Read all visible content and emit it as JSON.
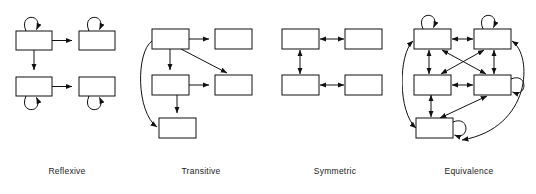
{
  "figure": {
    "background_color": "#ffffff",
    "line_color": "#111111",
    "label_color": "#1a1a1a",
    "panels": [
      {
        "id": "reflexive",
        "label": "Reflexive",
        "node_count": 4,
        "nodes": [
          {
            "id": "r-tl",
            "x": 16,
            "y": 31,
            "w": 36,
            "h": 19,
            "self_loop": "top"
          },
          {
            "id": "r-tr",
            "x": 79,
            "y": 31,
            "w": 36,
            "h": 19,
            "self_loop": "top"
          },
          {
            "id": "r-bl",
            "x": 16,
            "y": 77,
            "w": 36,
            "h": 19,
            "self_loop": "bottom"
          },
          {
            "id": "r-br",
            "x": 79,
            "y": 77,
            "w": 36,
            "h": 19,
            "self_loop": "bottom"
          }
        ],
        "edges": [
          {
            "from": "r-tl",
            "to": "r-tr",
            "style": "straight",
            "heads": 1
          },
          {
            "from": "r-tl",
            "to": "r-bl",
            "style": "straight",
            "heads": 1
          },
          {
            "from": "r-bl",
            "to": "r-br",
            "style": "straight",
            "heads": 1
          }
        ],
        "self_loop_count": 4
      },
      {
        "id": "transitive",
        "label": "Transitive",
        "node_count": 5,
        "nodes": [
          {
            "id": "t-tl",
            "x": 18,
            "y": 29,
            "w": 37,
            "h": 20,
            "self_loop": "none"
          },
          {
            "id": "t-tr",
            "x": 81,
            "y": 29,
            "w": 37,
            "h": 20,
            "self_loop": "none"
          },
          {
            "id": "t-ml",
            "x": 18,
            "y": 75,
            "w": 37,
            "h": 20,
            "self_loop": "none"
          },
          {
            "id": "t-mr",
            "x": 81,
            "y": 75,
            "w": 37,
            "h": 20,
            "self_loop": "none"
          },
          {
            "id": "t-bl",
            "x": 25,
            "y": 118,
            "w": 37,
            "h": 20,
            "self_loop": "none"
          }
        ],
        "edges": [
          {
            "from": "t-tl",
            "to": "t-tr",
            "style": "straight",
            "heads": 1
          },
          {
            "from": "t-tl",
            "to": "t-ml",
            "style": "straight",
            "heads": 1
          },
          {
            "from": "t-tl",
            "to": "t-mr",
            "style": "diagonal",
            "heads": 1
          },
          {
            "from": "t-ml",
            "to": "t-mr",
            "style": "straight",
            "heads": 1
          },
          {
            "from": "t-ml",
            "to": "t-bl",
            "style": "straight",
            "heads": 1
          },
          {
            "from": "t-tl",
            "to": "t-bl",
            "style": "curved-left",
            "heads": 1
          }
        ],
        "self_loop_count": 0
      },
      {
        "id": "symmetric",
        "label": "Symmetric",
        "node_count": 4,
        "nodes": [
          {
            "id": "s-tl",
            "x": 14,
            "y": 29,
            "w": 37,
            "h": 20,
            "self_loop": "none"
          },
          {
            "id": "s-tr",
            "x": 77,
            "y": 29,
            "w": 37,
            "h": 20,
            "self_loop": "none"
          },
          {
            "id": "s-bl",
            "x": 14,
            "y": 75,
            "w": 37,
            "h": 20,
            "self_loop": "none"
          },
          {
            "id": "s-br",
            "x": 77,
            "y": 75,
            "w": 37,
            "h": 20,
            "self_loop": "none"
          }
        ],
        "edges": [
          {
            "from": "s-tl",
            "to": "s-tr",
            "style": "straight",
            "heads": 2
          },
          {
            "from": "s-tl",
            "to": "s-bl",
            "style": "straight",
            "heads": 2
          },
          {
            "from": "s-bl",
            "to": "s-br",
            "style": "straight",
            "heads": 2
          }
        ],
        "self_loop_count": 0
      },
      {
        "id": "equivalence",
        "label": "Equivalence",
        "node_count": 5,
        "nodes": [
          {
            "id": "e-tl",
            "x": 12,
            "y": 29,
            "w": 37,
            "h": 20,
            "self_loop": "top"
          },
          {
            "id": "e-tr",
            "x": 72,
            "y": 29,
            "w": 37,
            "h": 20,
            "self_loop": "top"
          },
          {
            "id": "e-ml",
            "x": 12,
            "y": 75,
            "w": 37,
            "h": 20,
            "self_loop": "none"
          },
          {
            "id": "e-mr",
            "x": 72,
            "y": 75,
            "w": 37,
            "h": 20,
            "self_loop": "right"
          },
          {
            "id": "e-bl",
            "x": 14,
            "y": 118,
            "w": 37,
            "h": 20,
            "self_loop": "right"
          }
        ],
        "edges": [
          {
            "from": "e-tl",
            "to": "e-tr",
            "style": "straight",
            "heads": 2
          },
          {
            "from": "e-tl",
            "to": "e-ml",
            "style": "straight",
            "heads": 2
          },
          {
            "from": "e-tr",
            "to": "e-mr",
            "style": "straight",
            "heads": 2
          },
          {
            "from": "e-ml",
            "to": "e-mr",
            "style": "straight",
            "heads": 2
          },
          {
            "from": "e-tl",
            "to": "e-mr",
            "style": "diagonal",
            "heads": 2
          },
          {
            "from": "e-tr",
            "to": "e-ml",
            "style": "diagonal",
            "heads": 2
          },
          {
            "from": "e-ml",
            "to": "e-bl",
            "style": "straight",
            "heads": 2
          },
          {
            "from": "e-bl",
            "to": "e-mr",
            "style": "diagonal",
            "heads": 2
          },
          {
            "from": "e-tl",
            "to": "e-bl",
            "style": "curved-left",
            "heads": 2
          },
          {
            "from": "e-tr",
            "to": "e-bl",
            "style": "curved-right",
            "heads": 2
          }
        ],
        "self_loop_count": 4
      }
    ]
  }
}
